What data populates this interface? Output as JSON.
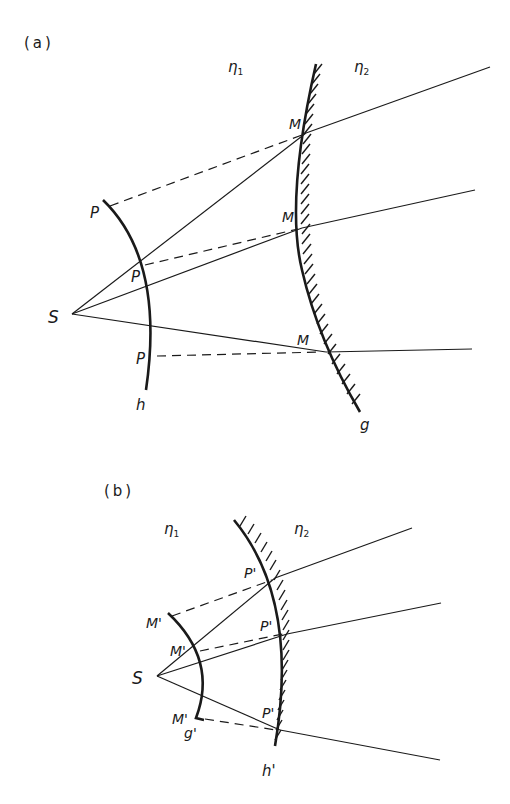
{
  "figure": {
    "panel_a": {
      "label": "(a)",
      "medium_left": "η",
      "medium_left_sub": "1",
      "medium_right": "η",
      "medium_right_sub": "2",
      "source": "S",
      "wavefront_label": "h",
      "mirror_label": "g",
      "points_p": [
        "P",
        "P",
        "P"
      ],
      "points_m": [
        "M",
        "M",
        "M"
      ]
    },
    "panel_b": {
      "label": "(b)",
      "medium_left": "η",
      "medium_left_sub": "1",
      "medium_right": "η",
      "medium_right_sub": "2",
      "source": "S",
      "wavefront_label": "g'",
      "mirror_label": "h'",
      "points_p": [
        "P'",
        "P'",
        "P'"
      ],
      "points_m": [
        "M'",
        "M'",
        "M'"
      ]
    }
  }
}
